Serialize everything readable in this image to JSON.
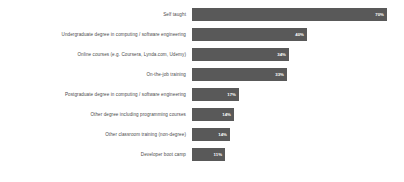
{
  "chart_data": {
    "type": "bar",
    "orientation": "horizontal",
    "title": "",
    "subtitle": "",
    "xlabel": "",
    "ylabel": "",
    "xlim": [
      0,
      70
    ],
    "grid": false,
    "legend": false,
    "value_suffix": "%",
    "bar_color": "#595959",
    "value_label_color": "#ffffff",
    "category_label_color": "#4c4c4c",
    "background": "#ffffff",
    "categories": [
      "Self taught",
      "Undergraduate degree in computing / software engineering",
      "Online courses (e.g. Coursera, Lynda.com, Udemy)",
      "On-the-job training",
      "Postgraduate degree in computing / software engineering",
      "Other degree including programming courses",
      "Other classroom training (non-degree)",
      "Developer boot camp"
    ],
    "values": [
      70,
      40,
      34,
      33,
      17,
      14,
      14,
      11
    ],
    "value_labels": [
      "70%",
      "40%",
      "34%",
      "33%",
      "17%",
      "14%",
      "14%",
      "11%"
    ],
    "bars": [
      {
        "label": "Self taught",
        "value": 70,
        "value_label": "70%",
        "width_px": 195
      },
      {
        "label": "Undergraduate degree in computing / software engineering",
        "value": 40,
        "value_label": "40%",
        "width_px": 115
      },
      {
        "label": "Online courses (e.g. Coursera, Lynda.com, Udemy)",
        "value": 34,
        "value_label": "34%",
        "width_px": 97
      },
      {
        "label": "On-the-job training",
        "value": 33,
        "value_label": "33%",
        "width_px": 95
      },
      {
        "label": "Postgraduate degree in computing / software engineering",
        "value": 17,
        "value_label": "17%",
        "width_px": 47
      },
      {
        "label": "Other degree including programming courses",
        "value": 14,
        "value_label": "14%",
        "width_px": 42
      },
      {
        "label": "Other classroom training (non-degree)",
        "value": 14,
        "value_label": "14%",
        "width_px": 38
      },
      {
        "label": "Developer boot camp",
        "value": 11,
        "value_label": "11%",
        "width_px": 33
      }
    ]
  }
}
